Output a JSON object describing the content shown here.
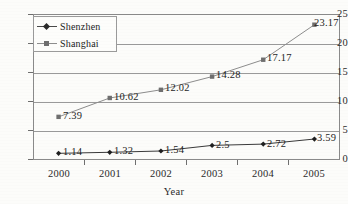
{
  "chart_data": {
    "type": "line",
    "title": "",
    "xlabel": "Year",
    "ylabel": "",
    "categories": [
      "2000",
      "2001",
      "2002",
      "2003",
      "2004",
      "2005"
    ],
    "ylim": [
      0,
      25
    ],
    "yticks": [
      "0",
      "5",
      "10",
      "15",
      "20",
      "25"
    ],
    "grid": true,
    "legend_position": "top-left",
    "series": [
      {
        "name": "Shenzhen",
        "marker": "diamond",
        "values": [
          1.14,
          1.32,
          1.54,
          2.5,
          2.72,
          3.59
        ],
        "labels": [
          "1.14",
          "1.32",
          "1.54",
          "2.5",
          "2.72",
          "3.59"
        ]
      },
      {
        "name": "Shanghai",
        "marker": "square",
        "values": [
          7.39,
          10.62,
          12.02,
          14.28,
          17.17,
          23.17
        ],
        "labels": [
          "7.39",
          "10.62",
          "12.02",
          "14.28",
          "17.17",
          "23.17"
        ]
      }
    ],
    "colors": {
      "shenzhen_line": "#3a3a3a",
      "shanghai_line": "#8d8d8d",
      "marker": "#1f1f1f",
      "grid": "#9a9a9a",
      "frame": "#8a8a8a",
      "text": "#1f1f1f",
      "background": "#fcfcfa"
    }
  }
}
